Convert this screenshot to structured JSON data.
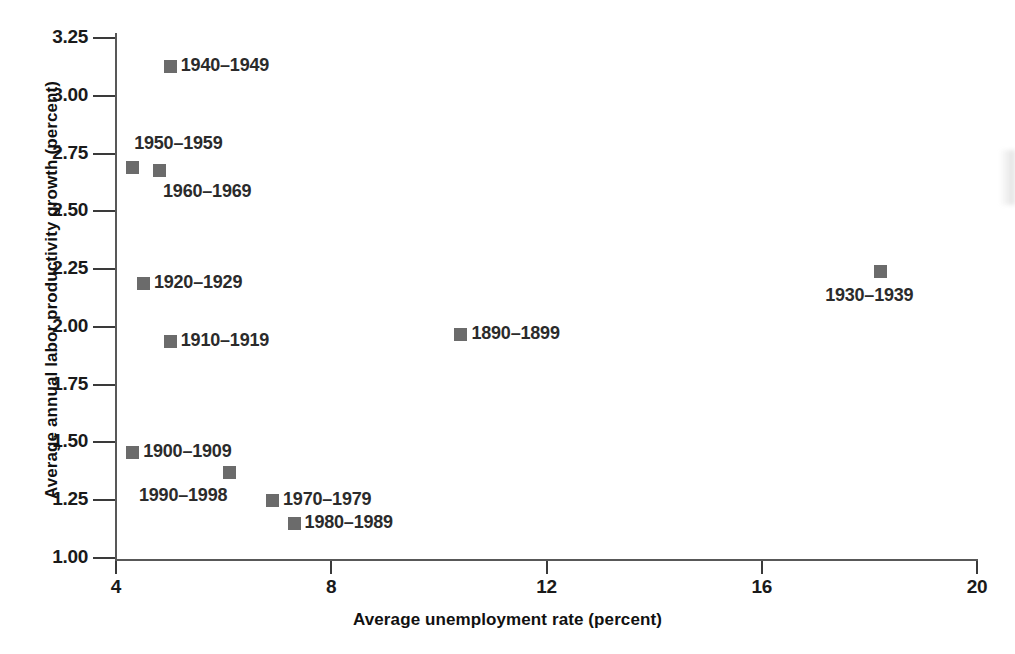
{
  "chart_data": {
    "type": "scatter",
    "title": "",
    "xlabel": "Average unemployment rate (percent)",
    "ylabel": "Average annual labor productivity growth (percent)",
    "xlim": [
      4,
      20
    ],
    "ylim": [
      1.0,
      3.25
    ],
    "xticks": [
      "4",
      "8",
      "12",
      "16",
      "20"
    ],
    "xtick_values": [
      4,
      8,
      12,
      16,
      20
    ],
    "yticks": [
      "1.00",
      "1.25",
      "1.50",
      "1.75",
      "2.00",
      "2.25",
      "2.50",
      "2.75",
      "3.00",
      "3.25"
    ],
    "ytick_values": [
      1.0,
      1.25,
      1.5,
      1.75,
      2.0,
      2.25,
      2.5,
      2.75,
      3.0,
      3.25
    ],
    "grid": false,
    "legend": "none",
    "marker_color": "#6b6b6b",
    "axis_color": "#585858",
    "points": [
      {
        "label": "1940–1949",
        "x": 5.0,
        "y": 3.13,
        "label_pos": "right"
      },
      {
        "label": "1950–1959",
        "x": 4.3,
        "y": 2.69,
        "label_pos": "above-right"
      },
      {
        "label": "1960–1969",
        "x": 4.8,
        "y": 2.68,
        "label_pos": "below-right"
      },
      {
        "label": "1920–1929",
        "x": 4.5,
        "y": 2.19,
        "label_pos": "right"
      },
      {
        "label": "1910–1919",
        "x": 5.0,
        "y": 1.94,
        "label_pos": "right"
      },
      {
        "label": "1930–1939",
        "x": 18.2,
        "y": 2.24,
        "label_pos": "below"
      },
      {
        "label": "1890–1899",
        "x": 10.4,
        "y": 1.97,
        "label_pos": "right"
      },
      {
        "label": "1900–1909",
        "x": 4.3,
        "y": 1.46,
        "label_pos": "right"
      },
      {
        "label": "1990–1998",
        "x": 6.1,
        "y": 1.37,
        "label_pos": "below-left"
      },
      {
        "label": "1970–1979",
        "x": 6.9,
        "y": 1.25,
        "label_pos": "right"
      },
      {
        "label": "1980–1989",
        "x": 7.3,
        "y": 1.15,
        "label_pos": "right"
      }
    ]
  }
}
